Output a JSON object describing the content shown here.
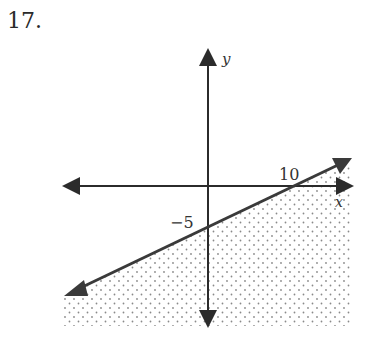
{
  "problem": {
    "number": "17."
  },
  "graph": {
    "axes": {
      "x_label": "x",
      "y_label": "y"
    },
    "tick_labels": {
      "x_intercept": "10",
      "y_intercept": "−5"
    },
    "boundary_line": {
      "style": "solid",
      "equation": "y = 0.5x - 5",
      "through": [
        [
          0,
          -5
        ],
        [
          10,
          0
        ]
      ]
    },
    "shading": {
      "region": "below line",
      "pattern": "dots"
    },
    "colors": {
      "axis": "#2b2b2b",
      "line": "#3a3a3a",
      "dots": "#8a8a8a"
    }
  }
}
